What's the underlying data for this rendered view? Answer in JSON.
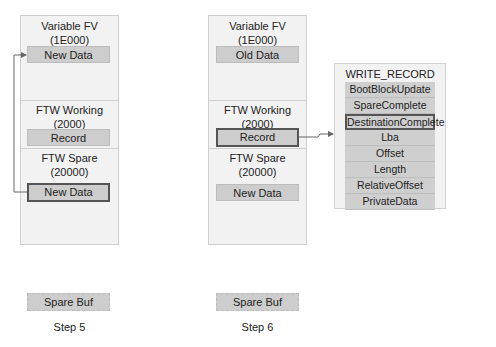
{
  "steps": [
    {
      "label": "Step 5",
      "variable_fv": {
        "title": "Variable FV",
        "address": "(1E000)",
        "block": "New Data"
      },
      "ftw_working": {
        "title": "FTW Working",
        "address": "(2000)",
        "block": "Record"
      },
      "ftw_spare": {
        "title": "FTW Spare",
        "address": "(20000)",
        "block": "New Data"
      },
      "spare_buf": "Spare Buf"
    },
    {
      "label": "Step 6",
      "variable_fv": {
        "title": "Variable FV",
        "address": "(1E000)",
        "block": "Old Data"
      },
      "ftw_working": {
        "title": "FTW Working",
        "address": "(2000)",
        "block": "Record"
      },
      "ftw_spare": {
        "title": "FTW Spare",
        "address": "(20000)",
        "block": "New Data"
      },
      "spare_buf": "Spare Buf"
    }
  ],
  "write_record": {
    "title": "WRITE_RECORD",
    "fields": [
      "BootBlockUpdate",
      "SpareComplete",
      "DestinationComplete",
      "Lba",
      "Offset",
      "Length",
      "RelativeOffset",
      "PrivateData"
    ],
    "highlighted_field": "DestinationComplete"
  },
  "colors": {
    "region_bg": "#f2f2f2",
    "block_bg": "#cdcdcd",
    "highlight_border": "#555555",
    "arrow": "#666666"
  }
}
